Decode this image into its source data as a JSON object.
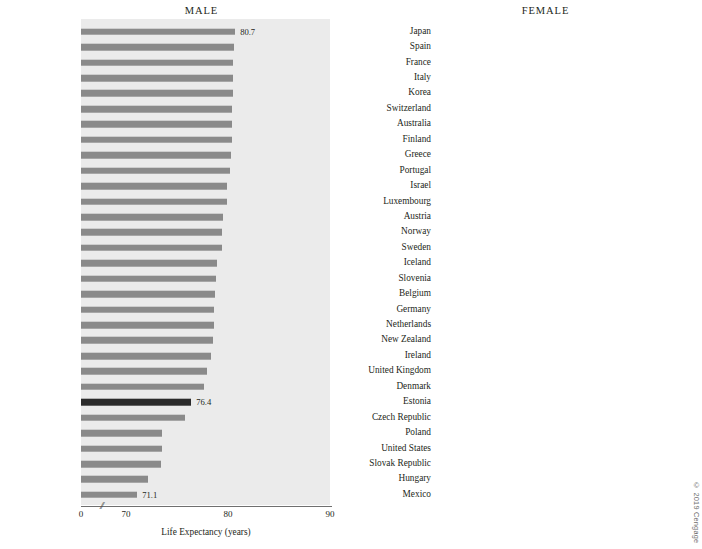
{
  "credit": "© 2019 Cengage",
  "chart_data": [
    {
      "type": "bar",
      "orientation": "horizontal",
      "title": "MALE",
      "xlabel": "Life Expectancy (years)",
      "ylabel": "",
      "xlim": [
        68,
        90
      ],
      "axis_break": true,
      "ticks": [
        0,
        70,
        80,
        90
      ],
      "tick_labels": [
        "0",
        "70",
        "80",
        "90"
      ],
      "grid": false,
      "highlight_category": "United States",
      "bar_color": "#8a8a8a",
      "highlight_color": "#2b2b2b",
      "plot_background": "#ebebeb",
      "categories": [
        "Switzerland",
        "Iceland",
        "Israel",
        "Italy",
        "Japan",
        "Spain",
        "Sweden",
        "Australia",
        "Luxembourg",
        "Noway",
        "Netherlands",
        "New Zealand",
        "United Kingdom",
        "France",
        "Ireland",
        "Greece",
        "Austria",
        "Germany",
        "Korea",
        "Denmark",
        "Belgium",
        "Finland",
        "Portugal",
        "Slovenia",
        "United States",
        "Czech Republic",
        "Poland",
        "Slovak Republic",
        "Estonia",
        "Hungary",
        "Mexico"
      ],
      "values": [
        80.7,
        80.6,
        80.5,
        80.5,
        80.5,
        80.4,
        80.4,
        80.4,
        80.3,
        80.2,
        79.9,
        79.9,
        79.5,
        79.4,
        79.4,
        78.9,
        78.8,
        78.7,
        78.6,
        78.6,
        78.5,
        78.3,
        77.9,
        77.6,
        76.4,
        75.8,
        73.5,
        73.5,
        73.4,
        72.2,
        71.1
      ],
      "labeled_values": [
        {
          "category": "Switzerland",
          "label": "80.7"
        },
        {
          "category": "United States",
          "label": "76.4"
        },
        {
          "category": "Mexico",
          "label": "71.1"
        }
      ]
    },
    {
      "type": "bar",
      "orientation": "horizontal",
      "title": "FEMALE",
      "xlabel": "Life Expectancy (years)",
      "ylabel": "",
      "xlim": [
        68,
        90
      ],
      "axis_break": true,
      "ticks": [
        0,
        70,
        80,
        90
      ],
      "tick_labels": [
        "0",
        "70",
        "80",
        "90"
      ],
      "grid": false,
      "highlight_category": "United States",
      "bar_color": "#8a8a8a",
      "highlight_color": "#2b2b2b",
      "plot_background": "#ebebeb",
      "categories": [
        "Japan",
        "Spain",
        "France",
        "Italy",
        "Korea",
        "Switzerland",
        "Australia",
        "Finland",
        "Greece",
        "Portugal",
        "Israel",
        "Luxembourg",
        "Austria",
        "Norway",
        "Sweden",
        "Iceland",
        "Slovenia",
        "Belgium",
        "Germany",
        "Netherlands",
        "New Zealand",
        "Ireland",
        "United Kingdom",
        "Denmark",
        "Estonia",
        "Czech Republic",
        "Poland",
        "United States",
        "Slovak Republic",
        "Hungary",
        "Mexico"
      ],
      "values": [
        86.6,
        86.0,
        85.6,
        85.4,
        85.3,
        85.2,
        84.7,
        84.4,
        84.3,
        84.3,
        84.2,
        84.2,
        84.1,
        84.1,
        84.1,
        84.0,
        83.9,
        83.7,
        83.7,
        83.7,
        83.6,
        83.6,
        83.4,
        83.0,
        82.5,
        82.2,
        82.2,
        81.2,
        80.2,
        79.7,
        77.4
      ],
      "labeled_values": [
        {
          "category": "Japan",
          "label": "86.6"
        },
        {
          "category": "United States",
          "label": "81.2"
        },
        {
          "category": "Mexico",
          "label": "77.4"
        }
      ]
    }
  ]
}
